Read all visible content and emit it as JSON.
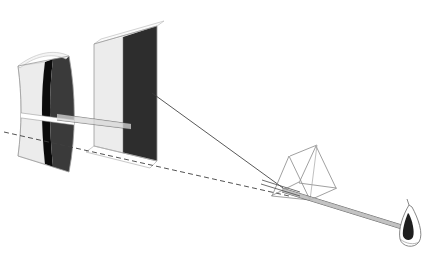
{
  "figure": {
    "title": "Newton prism experiment: dispersion of a light beam onto screens",
    "domain_kind": "scientific-line-drawing",
    "canvas": {
      "width": 426,
      "height": 256,
      "background": "#ffffff"
    }
  },
  "palette": {
    "background": "#ffffff",
    "screen_light": "#ececec",
    "screen_light_edge": "#d2d2d2",
    "screen_dark": "#383838",
    "screen_dark_flat": "#2b2b2b",
    "screen_black_stripe": "#0a0a0a",
    "outline": "#6b6b6b",
    "ray_solid": "#3a3a3a",
    "ray_dashed": "#4a4a4a",
    "prism_edge": "#8a8a8a",
    "beam_core": "#555555",
    "flame_fill": "#1f1f1f"
  },
  "elements": {
    "curved_screen": {
      "name": "Curved screen (far, leftmost)",
      "light_band_label": "light band",
      "black_stripe_label": "dark fringe",
      "dark_band_label": "shadow region",
      "outline_path": "M 18,66 C 22,96 22,126 18,156 L 69,172 C 76,136 76,94 69,56 Z",
      "light_region_path": "M 18,66 C 22,96 22,126 18,156 L 44,164 C 40,126 40,92 44,62 Z",
      "stripe_path": "M 44,62 C 40,92 40,126 44,164 L 52,167 C 48,128 48,92 52,59 Z",
      "dark_region_path": "M 52,59 C 48,92 48,128 52,167 L 69,172 C 76,136 76,94 69,56 Z",
      "top_edge_path": "M 18,66 C 33,54 52,48 69,56",
      "bottom_edge_path": "M 18,156 C 33,166 52,172 69,172"
    },
    "flat_screen": {
      "name": "Flat screen (near, second panel)",
      "light_band_label": "light band",
      "dark_band_label": "shadow region",
      "outline_path": "M 94,44 L 94,146 L 157,161 L 157,26 Z",
      "light_region_path": "M 94,44 L 94,146 L 123,153 L 123,37 Z",
      "dark_region_path": "M 123,37 L 123,153 L 157,161 L 157,26 Z",
      "top_sliver_path": "M 94,44 L 100,39 L 163,21 L 157,26 Z",
      "bottom_base_path": "M 94,146 L 100,151 L 163,167 L 157,161 Z"
    },
    "prism": {
      "name": "Triangular glass prism",
      "front_face_path": "M 272,196 L 289,156 L 310,200 Z",
      "back_face_path": "M 299,183 L 316,146 L 336,188 Z",
      "top_connector_a": "M 289,156 L 316,146",
      "top_connector_b": "M 272,196 L 299,183",
      "bottom_connector": "M 310,200 L 336,188",
      "inner_vertical": "M 316,146 L 310,200",
      "inner_edge_back": "M 299,183 L 336,188"
    },
    "light_source": {
      "name": "Candle flame (light source)",
      "label": "flame",
      "outline_path": "M 409,207 C 404,216 399,228 401,238 C 403,246 414,247 418,241 C 422,234 418,220 412,210 Z",
      "inner_path": "M 409,216 C 406,222 403,230 404,235 C 406,240 412,240 414,236 C 416,231 413,222 410,217 Z",
      "wick_path": "M 409,207 L 408,202"
    },
    "rays": {
      "solid_upper_label": "refracted beam (upper edge)",
      "solid_upper_path": "M 152,93 L 283,188",
      "dashed_lower_label": "construction line (undeviated direction)",
      "dashed_lower_path": "M 4,132 L 289,196",
      "beam_through_slit_label": "narrow beam through slit",
      "beam_slit_path": "M 56,117 L 126,124",
      "beam_slit_path2": "M 56,120 L 126,127",
      "beam_prism_to_flame_a": "M 283,189 L 404,226",
      "beam_prism_to_flame_b": "M 283,192 L 404,229",
      "beam_incident_a": "M 267,183 L 300,193",
      "beam_incident_b": "M 263,186 L 300,196"
    }
  },
  "annotations": {
    "visible_text": [],
    "note": "No textual labels are printed in this figure."
  }
}
